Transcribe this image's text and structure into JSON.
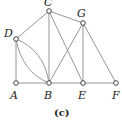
{
  "caption": "(c)",
  "colors": {
    "edge": "#8a8a8a",
    "node_stroke": "#444444",
    "text": "#222222"
  },
  "nodes": [
    {
      "id": "A",
      "label": "A",
      "x": 16,
      "y": 83
    },
    {
      "id": "B",
      "label": "B",
      "x": 49,
      "y": 83
    },
    {
      "id": "C",
      "label": "C",
      "x": 49,
      "y": 11
    },
    {
      "id": "D",
      "label": "D",
      "x": 16,
      "y": 39
    },
    {
      "id": "E",
      "label": "E",
      "x": 83,
      "y": 83
    },
    {
      "id": "F",
      "label": "F",
      "x": 116,
      "y": 83
    },
    {
      "id": "G",
      "label": "G",
      "x": 83,
      "y": 23
    }
  ],
  "edges": [
    [
      "A",
      "B"
    ],
    [
      "B",
      "E"
    ],
    [
      "E",
      "F"
    ],
    [
      "A",
      "D"
    ],
    [
      "D",
      "C"
    ],
    [
      "C",
      "G"
    ],
    [
      "C",
      "B"
    ],
    [
      "C",
      "E"
    ],
    [
      "G",
      "B"
    ],
    [
      "G",
      "E"
    ],
    [
      "G",
      "F"
    ],
    [
      "D",
      "B",
      "curve-upper"
    ],
    [
      "D",
      "B",
      "curve-lower"
    ]
  ]
}
